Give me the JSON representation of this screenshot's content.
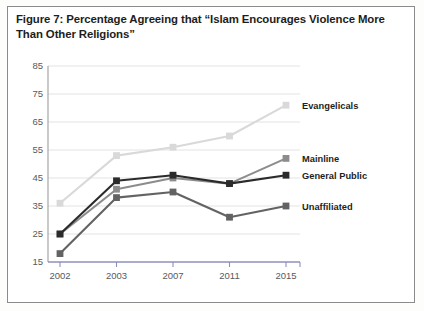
{
  "figure": {
    "caption": "Figure 7: Percentage Agreeing that “Islam Encourages Violence More Than Other Religions”"
  },
  "colors": {
    "evangelicals": "#d9d9d9",
    "mainline": "#8c8c8c",
    "general_public": "#2b2b2b",
    "unaffiliated": "#636363",
    "grid": "#e3e3e6",
    "y_axis": "#a6a6a6",
    "x_axis": "#8d8fbf",
    "tick_text": "#58595b",
    "label_text": "#231f20",
    "frame_border": "#8b8b8b",
    "page_background": "#ffffff"
  },
  "chart_data": {
    "type": "line",
    "title": "Percentage Agreeing that “Islam Encourages Violence More Than Other Religions”",
    "xlabel": "",
    "ylabel": "",
    "categories": [
      "2002",
      "2003",
      "2007",
      "2011",
      "2015"
    ],
    "x": [
      2002,
      2003,
      2007,
      2011,
      2015
    ],
    "ylim": [
      15,
      85
    ],
    "yticks": [
      15,
      25,
      35,
      45,
      55,
      65,
      75,
      85
    ],
    "ytick_labels": [
      "15",
      "25",
      "35",
      "45",
      "55",
      "65",
      "75",
      "85"
    ],
    "grid": true,
    "grid_axis": "y",
    "legend": "inline-right-of-line-ends",
    "markers": "square",
    "series": [
      {
        "name": "Evangelicals",
        "color": "#d9d9d9",
        "values": [
          36,
          53,
          56,
          60,
          71
        ],
        "label_x": "2015",
        "label_y": 71
      },
      {
        "name": "Mainline",
        "color": "#8c8c8c",
        "values": [
          25,
          41,
          45,
          43,
          52
        ],
        "label_x": "2015",
        "label_y": 52
      },
      {
        "name": "General Public",
        "color": "#2b2b2b",
        "values": [
          25,
          44,
          46,
          43,
          46
        ],
        "label_x": "2015",
        "label_y": 46
      },
      {
        "name": "Unaffiliated",
        "color": "#636363",
        "values": [
          18,
          38,
          40,
          31,
          35
        ],
        "label_x": "2015",
        "label_y": 35
      }
    ]
  }
}
